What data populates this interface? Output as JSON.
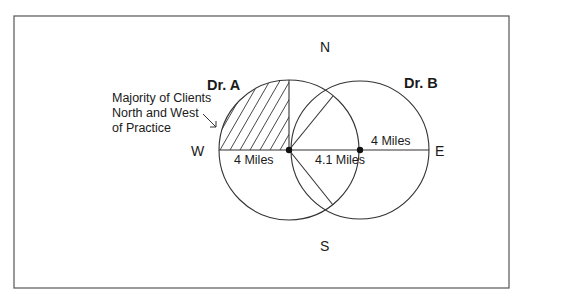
{
  "diagram": {
    "type": "venn-radius-map",
    "frame": {
      "x": 14,
      "y": 16,
      "width": 495,
      "height": 272,
      "stroke": "#555555"
    },
    "colors": {
      "line": "#333333",
      "text": "#1a1a1a",
      "background": "#ffffff"
    },
    "compass": {
      "north": "N",
      "south": "S",
      "east": "E",
      "west": "W"
    },
    "practices": [
      {
        "label": "Dr. A",
        "center": [
          289,
          150
        ],
        "radius_px": 70,
        "radius_label": "4 Miles"
      },
      {
        "label": "Dr. B",
        "center": [
          360,
          150
        ],
        "radius_px": 69,
        "radius_label": "4 Miles"
      }
    ],
    "distance_between": "4.1 Miles",
    "annotation": {
      "lines": [
        "Majority of Clients",
        "North and West",
        "of Practice"
      ]
    }
  }
}
